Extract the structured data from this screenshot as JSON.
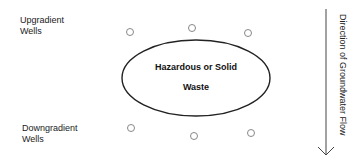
{
  "labels": {
    "upgradient": [
      "Upgradient",
      "Wells"
    ],
    "downgradient": [
      "Downgradient",
      "Wells"
    ],
    "waste": [
      "Hazardous or Solid",
      "Waste"
    ],
    "flow_direction": "Direction of Groundwater Flow"
  },
  "wells": {
    "upgradient": [
      {
        "x": 130,
        "y": 32
      },
      {
        "x": 192,
        "y": 28
      },
      {
        "x": 248,
        "y": 33
      }
    ],
    "downgradient": [
      {
        "x": 131,
        "y": 128
      },
      {
        "x": 194,
        "y": 136
      },
      {
        "x": 251,
        "y": 133
      }
    ]
  },
  "colors": {
    "stroke": "#222222",
    "well": "#888888"
  }
}
